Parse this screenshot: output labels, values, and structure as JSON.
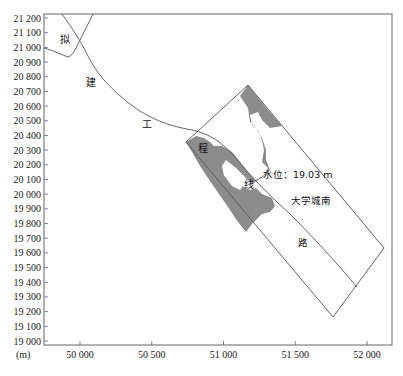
{
  "figure": {
    "unit_label": "(m)",
    "water_level_label": "水位：19.03 m",
    "region_labels": {
      "ni": "拟",
      "jian": "建",
      "gong": "工",
      "cheng": "程",
      "xian": "线",
      "road_name": "大学城南",
      "road_suffix": "路"
    },
    "colors": {
      "flood_area": "#8c8c8c",
      "lines": "#555555",
      "frame": "#666666"
    }
  },
  "chart_data": {
    "type": "map",
    "title": "",
    "xlabel": "(m)",
    "ylabel": "",
    "x_ticks": [
      "50 000",
      "50 500",
      "51 000",
      "51 500",
      "52 000"
    ],
    "x_tick_values": [
      50000,
      50500,
      51000,
      51500,
      52000
    ],
    "y_ticks": [
      "21 200",
      "21 100",
      "21 000",
      "20 900",
      "20 800",
      "20 700",
      "20 600",
      "20 500",
      "20 400",
      "20 300",
      "20 200",
      "20 100",
      "20 000",
      "19 900",
      "19 800",
      "19 700",
      "19 600",
      "19 500",
      "19 400",
      "19 300",
      "19 200",
      "19 100",
      "19 000"
    ],
    "y_tick_values": [
      21200,
      21100,
      21000,
      20900,
      20800,
      20700,
      20600,
      20500,
      20400,
      20300,
      20200,
      20100,
      20000,
      19900,
      19800,
      19700,
      19600,
      19500,
      19400,
      19300,
      19200,
      19100,
      19000
    ],
    "xlim": [
      49750,
      52200
    ],
    "ylim": [
      18970,
      21230
    ],
    "annotations": [
      "拟",
      "建",
      "工",
      "程",
      "线",
      "水位：19.03 m",
      "大学城南",
      "路"
    ],
    "features": [
      {
        "name": "proposed-route-line",
        "description": "curved line of proposed engineering route from top-left toward lower-right"
      },
      {
        "name": "road-rectangle",
        "description": "rotated rectangle representing 大学城南路 road area"
      },
      {
        "name": "flooded-area",
        "description": "gray shaded inundation zone at water level 19.03 m"
      }
    ],
    "grid": false
  }
}
